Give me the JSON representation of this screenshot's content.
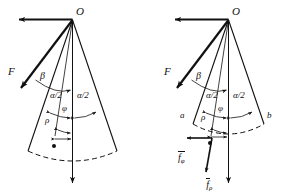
{
  "figure": {
    "background_color": "#ffffff",
    "stroke_color": "#111111",
    "width": 285,
    "height": 193,
    "panels": [
      {
        "id": "left-panel",
        "name": "sector-diagram-left",
        "apex_label": "O",
        "force_label": "F",
        "angles": {
          "beta": "β",
          "alpha_half_left": "α/2",
          "alpha_half_right": "α/2",
          "phi": "φ"
        },
        "radius_label": "ρ",
        "edge_labels": [],
        "vectors": []
      },
      {
        "id": "right-panel",
        "name": "sector-diagram-right",
        "apex_label": "O",
        "force_label": "F",
        "angles": {
          "beta": "β",
          "alpha_half_left": "α/2",
          "alpha_half_right": "α/2",
          "phi": "φ"
        },
        "radius_label": "ρ",
        "edge_labels": [
          {
            "key": "a",
            "text": "a"
          },
          {
            "key": "b",
            "text": "b"
          }
        ],
        "vectors": [
          {
            "key": "f_phi",
            "symbol": "f",
            "subscript": "φ",
            "overbar": true,
            "direction": "left"
          },
          {
            "key": "f_rho",
            "symbol": "f",
            "subscript": "ρ",
            "overbar": true,
            "direction": "down"
          }
        ]
      }
    ]
  }
}
